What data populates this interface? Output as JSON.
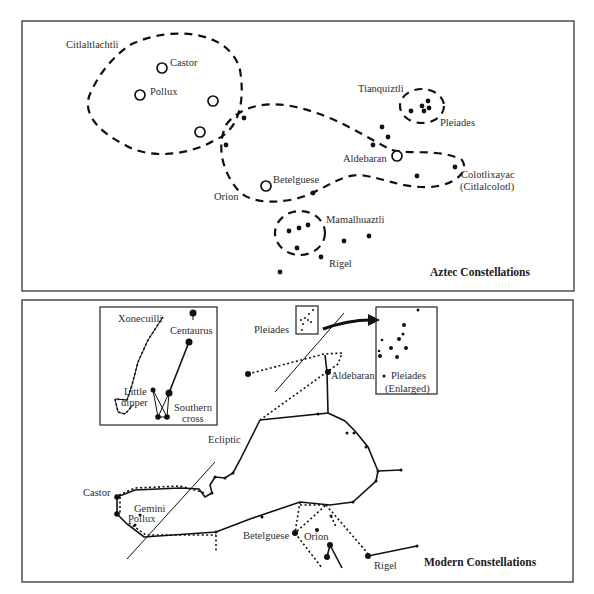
{
  "top_panel": {
    "title": "Aztec Constellations",
    "labels": {
      "citlaltlachtli": "Citlaltlachtli",
      "castor": "Castor",
      "pollux": "Pollux",
      "tianquiztli": "Tianquiztli",
      "pleiades": "Pleiades",
      "aldebaran": "Aldebaran",
      "betelguese": "Betelguese",
      "orion": "Orion",
      "colotlixayac": "Colotlixayac",
      "citlalcolotl": "(Citlalcolotl)",
      "mamalhuaztli": "Mamalhuaztli",
      "rigel": "Rigel"
    }
  },
  "bottom_panel": {
    "title": "Modern Constellations",
    "labels": {
      "xonecuilli": "Xonecuilli",
      "centaurus": "Centaurus",
      "little": "Little",
      "dipper": "dipper",
      "southern": "Southern",
      "cross": "cross",
      "pleiades": "Pleiades",
      "aldebaran": "Aldebaran",
      "pleiades_enlarged_1": "Pleiades",
      "pleiades_enlarged_2": "(Enlarged)",
      "ecliptic": "Ecliptic",
      "castor": "Castor",
      "gemini": "Gemini",
      "pollux": "Pollux",
      "betelguese": "Betelguese",
      "orion": "Orion",
      "rigel": "Rigel"
    }
  },
  "colors": {
    "ink": "#111111",
    "text": "#2e2e2e",
    "frame": "#333333",
    "background": "#ffffff"
  }
}
